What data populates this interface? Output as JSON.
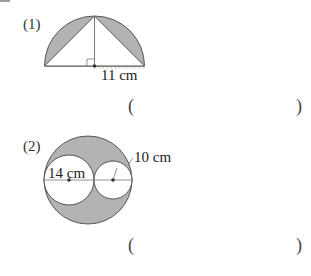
{
  "problems": [
    {
      "number": "(1)",
      "figure": {
        "shape": "semicircle with inscribed triangle, shaded segments",
        "dimension_label": "11 cm"
      },
      "answer_open": "(",
      "answer_close": ")"
    },
    {
      "number": "(2)",
      "figure": {
        "shape": "large circle containing two tangent white circles, shaded remainder",
        "dimension_label_large": "14 cm",
        "dimension_label_small": "10 cm"
      },
      "answer_open": "(",
      "answer_close": ")"
    }
  ],
  "colors": {
    "shade": "#b3b3b3",
    "line": "#555555"
  }
}
